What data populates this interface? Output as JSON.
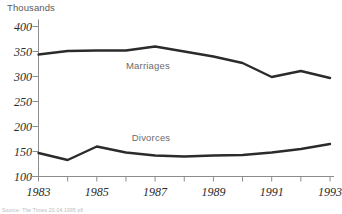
{
  "chart_data": {
    "type": "line",
    "title": "",
    "xlabel": "",
    "ylabel": "Thousands",
    "unit_label": "Thousands",
    "x": [
      1983,
      1984,
      1985,
      1986,
      1987,
      1988,
      1989,
      1990,
      1991,
      1992,
      1993
    ],
    "xlim": [
      1983,
      1993
    ],
    "ylim": [
      100,
      400
    ],
    "yticks": [
      100,
      150,
      200,
      250,
      300,
      350,
      400
    ],
    "ytick_labels": [
      "100",
      "150",
      "200",
      "250",
      "300",
      "350",
      "400"
    ],
    "xticks": [
      1983,
      1984,
      1985,
      1986,
      1987,
      1988,
      1989,
      1990,
      1991,
      1992,
      1993
    ],
    "xtick_labels_shown": [
      "1983",
      "1985",
      "1987",
      "1989",
      "1991",
      "1993"
    ],
    "xtick_labels_shown_values": [
      1983,
      1985,
      1987,
      1989,
      1991,
      1993
    ],
    "grid": false,
    "legend_position": "inline-annotation",
    "series": [
      {
        "name": "Marriages",
        "color": "#2b2b2b",
        "label_x": 1986.0,
        "label_y": 322,
        "values": [
          344,
          351,
          352,
          352,
          360,
          350,
          340,
          327,
          299,
          311,
          297
        ]
      },
      {
        "name": "Divorces",
        "color": "#2b2b2b",
        "label_x": 1986.2,
        "label_y": 178,
        "values": [
          147,
          133,
          160,
          148,
          142,
          140,
          142,
          143,
          148,
          155,
          165
        ]
      }
    ]
  },
  "footer": {
    "source_note": "Source: The Times 20.04.1995 p6"
  },
  "colors": {
    "line": "#2b2b2b",
    "axis": "#8c8c8c",
    "tick_text": "#2b2b2b",
    "unit_text": "#5a5a5a",
    "series_label": "#6b6b6b",
    "background": "#ffffff"
  }
}
